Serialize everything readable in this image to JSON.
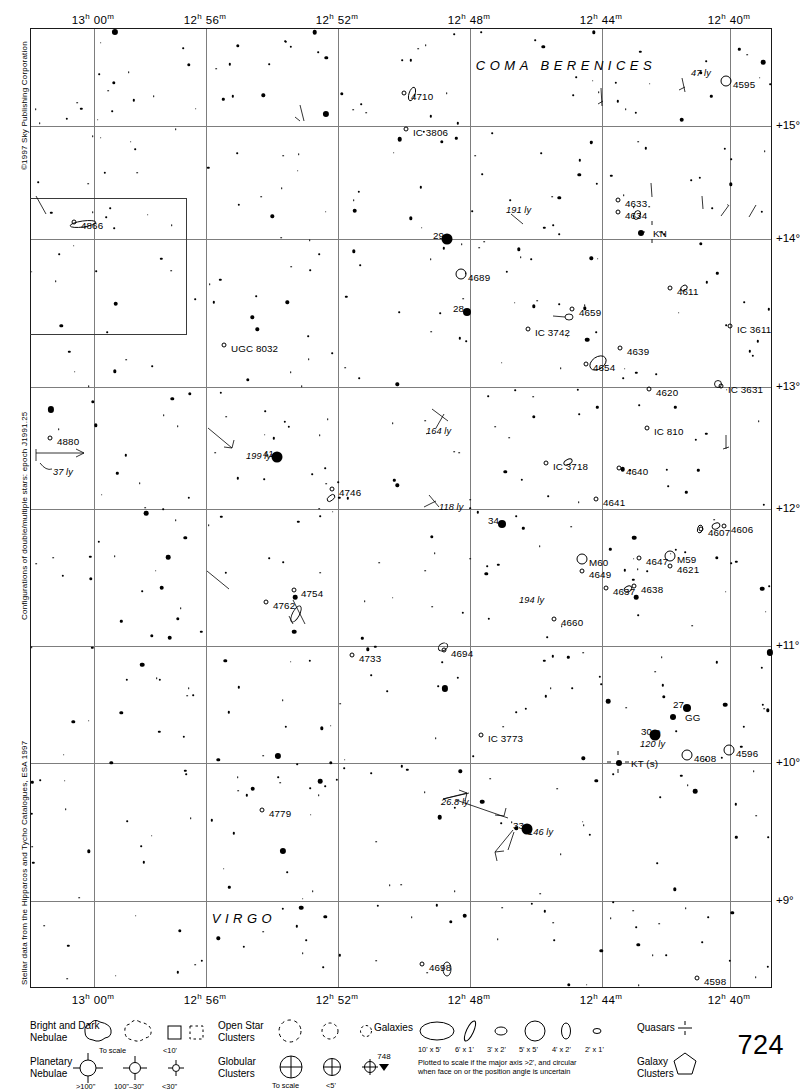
{
  "chart": {
    "page_number": "724",
    "continuation_number": "748",
    "copyright": "©1997 Sky Publishing Corporation",
    "credit_double_stars": "Configurations of double/multiple stars: epoch J1991.25",
    "credit_stellar_data": "Stellar data from the Hipparcos and Tycho Catalogues, ESA 1997",
    "ra_ticks": [
      {
        "label": "13h 00m",
        "h": "13",
        "m": "00",
        "x": 93
      },
      {
        "label": "12h 56m",
        "h": "12",
        "m": "56",
        "x": 205
      },
      {
        "label": "12h 52m",
        "h": "12",
        "m": "52",
        "x": 337
      },
      {
        "label": "12h 48m",
        "h": "12",
        "m": "48",
        "x": 469
      },
      {
        "label": "12h 44m",
        "h": "12",
        "m": "44",
        "x": 601
      },
      {
        "label": "12h 40m",
        "h": "12",
        "m": "40",
        "x": 729
      }
    ],
    "dec_ticks": [
      {
        "label": "+15°",
        "y": 125
      },
      {
        "label": "+14°",
        "y": 238
      },
      {
        "label": "+13°",
        "y": 386
      },
      {
        "label": "+12°",
        "y": 508
      },
      {
        "label": "+11°",
        "y": 645
      },
      {
        "label": "+10°",
        "y": 762
      },
      {
        "label": "+9°",
        "y": 900
      }
    ],
    "constellations": [
      {
        "name": "COMA BERENICES",
        "x": 565,
        "y": 64
      },
      {
        "name": "VIRGO",
        "x": 243,
        "y": 917
      }
    ]
  },
  "chart_data": {
    "type": "scatter",
    "xlabel": "Right Ascension",
    "ylabel": "Declination",
    "xlim": [
      "13h 02m",
      "12h 38m"
    ],
    "ylim": [
      8.5,
      15.5
    ],
    "grid": true,
    "legend": "bottom",
    "labeled_objects": [
      {
        "name": "4710",
        "type": "galaxy",
        "x": 410,
        "y": 95
      },
      {
        "name": "IC 3806",
        "type": "galaxy",
        "x": 412,
        "y": 131
      },
      {
        "name": "47 ly",
        "type": "distance",
        "x": 690,
        "y": 72
      },
      {
        "name": "4595",
        "type": "galaxy",
        "x": 732,
        "y": 83
      },
      {
        "name": "191 ly",
        "type": "distance",
        "x": 505,
        "y": 209
      },
      {
        "name": "4633",
        "type": "galaxy",
        "x": 624,
        "y": 202
      },
      {
        "name": "4634",
        "type": "galaxy",
        "x": 624,
        "y": 214
      },
      {
        "name": "KN",
        "type": "variable",
        "x": 652,
        "y": 232
      },
      {
        "name": "29",
        "type": "star",
        "x": 432,
        "y": 234
      },
      {
        "name": "4866",
        "type": "galaxy",
        "x": 80,
        "y": 224
      },
      {
        "name": "4689",
        "type": "galaxy",
        "x": 467,
        "y": 276
      },
      {
        "name": "4611",
        "type": "galaxy",
        "x": 676,
        "y": 290
      },
      {
        "name": "28",
        "type": "star",
        "x": 452,
        "y": 307
      },
      {
        "name": "4659",
        "type": "galaxy",
        "x": 578,
        "y": 311
      },
      {
        "name": "IC 3742",
        "type": "galaxy",
        "x": 534,
        "y": 331
      },
      {
        "name": "IC 3611",
        "type": "galaxy",
        "x": 736,
        "y": 328
      },
      {
        "name": "UGC 8032",
        "type": "galaxy",
        "x": 230,
        "y": 347
      },
      {
        "name": "4639",
        "type": "galaxy",
        "x": 626,
        "y": 350
      },
      {
        "name": "4654",
        "type": "galaxy",
        "x": 592,
        "y": 366
      },
      {
        "name": "4620",
        "type": "galaxy",
        "x": 655,
        "y": 391
      },
      {
        "name": "IC 3631",
        "type": "galaxy",
        "x": 727,
        "y": 388
      },
      {
        "name": "4880",
        "type": "galaxy",
        "x": 56,
        "y": 440
      },
      {
        "name": "37 ly",
        "type": "distance",
        "x": 52,
        "y": 471
      },
      {
        "name": "164 ly",
        "type": "distance",
        "x": 425,
        "y": 430
      },
      {
        "name": "IC 810",
        "type": "galaxy",
        "x": 653,
        "y": 430
      },
      {
        "name": "41",
        "type": "star",
        "x": 262,
        "y": 452
      },
      {
        "name": "199 ly",
        "type": "distance",
        "x": 245,
        "y": 455
      },
      {
        "name": "IC 3718",
        "type": "galaxy",
        "x": 552,
        "y": 465
      },
      {
        "name": "4640",
        "type": "galaxy",
        "x": 625,
        "y": 470
      },
      {
        "name": "4746",
        "type": "galaxy",
        "x": 338,
        "y": 491
      },
      {
        "name": "4641",
        "type": "galaxy",
        "x": 602,
        "y": 501
      },
      {
        "name": "118 ly",
        "type": "distance",
        "x": 438,
        "y": 506
      },
      {
        "name": "34",
        "type": "star",
        "x": 487,
        "y": 519
      },
      {
        "name": "4607",
        "type": "galaxy",
        "x": 707,
        "y": 531
      },
      {
        "name": "4606",
        "type": "galaxy",
        "x": 730,
        "y": 528
      },
      {
        "name": "M59",
        "type": "galaxy",
        "x": 676,
        "y": 558
      },
      {
        "name": "4621",
        "type": "galaxy",
        "x": 676,
        "y": 568
      },
      {
        "name": "M60",
        "type": "galaxy",
        "x": 588,
        "y": 561
      },
      {
        "name": "4649",
        "type": "galaxy",
        "x": 588,
        "y": 573
      },
      {
        "name": "4647",
        "type": "galaxy",
        "x": 645,
        "y": 560
      },
      {
        "name": "4637",
        "type": "galaxy",
        "x": 612,
        "y": 590
      },
      {
        "name": "4638",
        "type": "galaxy",
        "x": 640,
        "y": 588
      },
      {
        "name": "4754",
        "type": "galaxy",
        "x": 300,
        "y": 592
      },
      {
        "name": "4762",
        "type": "galaxy",
        "x": 272,
        "y": 604
      },
      {
        "name": "194 ly",
        "type": "distance",
        "x": 518,
        "y": 599
      },
      {
        "name": "4660",
        "type": "galaxy",
        "x": 560,
        "y": 621
      },
      {
        "name": "4733",
        "type": "galaxy",
        "x": 358,
        "y": 657
      },
      {
        "name": "4694",
        "type": "galaxy",
        "x": 450,
        "y": 652
      },
      {
        "name": "27",
        "type": "star",
        "x": 672,
        "y": 703
      },
      {
        "name": "GG",
        "type": "variable",
        "x": 684,
        "y": 716
      },
      {
        "name": "30 ρ",
        "type": "star",
        "x": 640,
        "y": 730
      },
      {
        "name": "120 ly",
        "type": "distance",
        "x": 639,
        "y": 743
      },
      {
        "name": "IC 3773",
        "type": "galaxy",
        "x": 487,
        "y": 737
      },
      {
        "name": "KT (s)",
        "type": "variable",
        "x": 630,
        "y": 762
      },
      {
        "name": "4608",
        "type": "galaxy",
        "x": 693,
        "y": 757
      },
      {
        "name": "4596",
        "type": "galaxy",
        "x": 735,
        "y": 752
      },
      {
        "name": "4779",
        "type": "galaxy",
        "x": 268,
        "y": 812
      },
      {
        "name": "26.8 ly",
        "type": "distance",
        "x": 440,
        "y": 801
      },
      {
        "name": "33",
        "type": "star",
        "x": 512,
        "y": 824
      },
      {
        "name": "146 ly",
        "type": "distance",
        "x": 527,
        "y": 831
      },
      {
        "name": "4698",
        "type": "galaxy",
        "x": 428,
        "y": 966
      },
      {
        "name": "4598",
        "type": "galaxy",
        "x": 703,
        "y": 980
      }
    ]
  },
  "legend": {
    "bright_dark_nebulae": {
      "label": "Bright and Dark\nNebulae",
      "scale_note": "To scale",
      "small_note": "<10'"
    },
    "planetary_nebulae": {
      "label": "Planetary\nNebulae",
      "sizes": [
        ">100\"",
        "100\"–30\"",
        "<30\""
      ]
    },
    "open_star_clusters": {
      "label": "Open Star\nClusters"
    },
    "globular_clusters": {
      "label": "Globular\nClusters",
      "scale_note": "To scale",
      "small_note": "<5'"
    },
    "galaxies": {
      "label": "Galaxies",
      "sizes": [
        "10' x 5'",
        "6' x 1'",
        "3' x 2'",
        "5' x 5'",
        "4' x 2'",
        "2' x 1'"
      ],
      "note": "Plotted to scale if the major axis >2', and circular\nwhen face on or the position angle is uncertain"
    },
    "quasars": {
      "label": "Quasars"
    },
    "galaxy_clusters": {
      "label": "Galaxy\nClusters"
    }
  }
}
